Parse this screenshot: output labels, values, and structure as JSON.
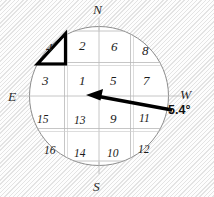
{
  "figure": {
    "type": "compass-grid-diagram",
    "background_color": "#f3f3f3",
    "circle": {
      "fill_color": "#ffffff",
      "stroke_color": "#8d8d8d",
      "center_x": 99,
      "center_y": 96,
      "radius": 70
    }
  },
  "cardinals": {
    "north": "N",
    "south": "S",
    "east": "E",
    "west": "W"
  },
  "grid": {
    "rows": 4,
    "columns": 4,
    "line_color": "#b8b8b8",
    "cells": [
      [
        {
          "label": "4",
          "highlighted": true
        },
        {
          "label": "2",
          "highlighted": false
        },
        {
          "label": "6",
          "highlighted": false
        },
        {
          "label": "8",
          "highlighted": false
        }
      ],
      [
        {
          "label": "3",
          "highlighted": false
        },
        {
          "label": "1",
          "highlighted": false
        },
        {
          "label": "5",
          "highlighted": false
        },
        {
          "label": "7",
          "highlighted": false
        }
      ],
      [
        {
          "label": "15",
          "highlighted": false
        },
        {
          "label": "13",
          "highlighted": false
        },
        {
          "label": "9",
          "highlighted": false
        },
        {
          "label": "11",
          "highlighted": false
        }
      ],
      [
        {
          "label": "16",
          "highlighted": false
        },
        {
          "label": "14",
          "highlighted": false
        },
        {
          "label": "10",
          "highlighted": false
        },
        {
          "label": "12",
          "highlighted": false
        }
      ]
    ]
  },
  "highlight": {
    "target_cell": "4",
    "shape": "triangle",
    "stroke_color": "#000000"
  },
  "arrow": {
    "color": "#000000",
    "points_to": "center",
    "origin_side": "west",
    "angle_label": "5.4°"
  }
}
